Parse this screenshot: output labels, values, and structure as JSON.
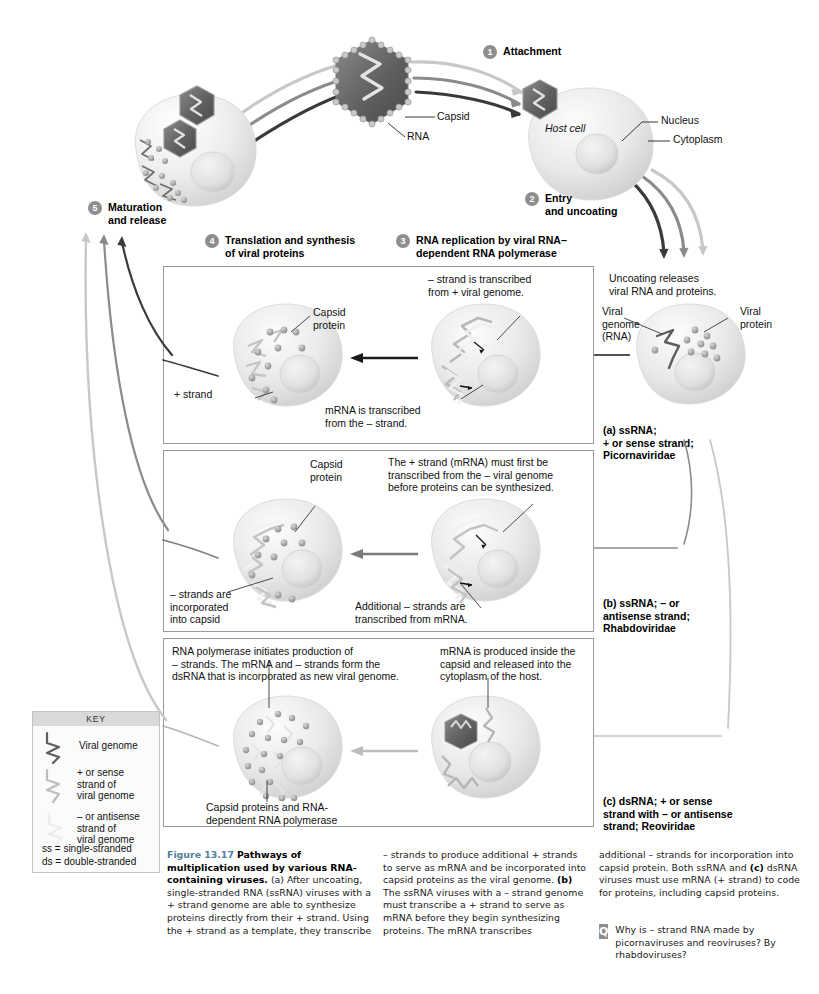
{
  "figure": {
    "number": "Figure 13.17",
    "title": "Pathways of multiplication used by various RNA-containing viruses.",
    "caption_col1": "(a) After uncoating, single-stranded RNA (ssRNA) viruses with a + strand genome are able to synthesize proteins directly from their + strand. Using the + strand as a template, they transcribe",
    "caption_col2_a": "– strands to produce additional + strands to serve as mRNA and be incorporated into capsid proteins as the viral genome.",
    "caption_col2_b_bold": "(b)",
    "caption_col2_b": " The ssRNA viruses with a – strand genome must transcribe a + strand to serve as mRNA before they begin synthesizing proteins. The mRNA transcribes",
    "caption_col3_a": "additional – strands for incorporation into capsid protein. Both ssRNA and",
    "caption_col3_c_bold": "(c)",
    "caption_col3_c": " dsRNA viruses must use mRNA (+ strand) to code for proteins, including capsid proteins.",
    "question_badge": "Q",
    "question": "Why is – strand RNA made by picornaviruses and reoviruses? By rhabdoviruses?"
  },
  "steps": [
    {
      "num": "1",
      "label": "Attachment"
    },
    {
      "num": "2",
      "label": "Entry\nand uncoating"
    },
    {
      "num": "3",
      "label": "RNA replication by viral RNA–\ndependent RNA polymerase"
    },
    {
      "num": "4",
      "label": "Translation and synthesis\nof viral proteins"
    },
    {
      "num": "5",
      "label": "Maturation\nand release"
    }
  ],
  "top_labels": {
    "capsid": "Capsid",
    "rna": "RNA",
    "nucleus": "Nucleus",
    "cytoplasm": "Cytoplasm",
    "host_cell": "Host cell"
  },
  "uncoating": {
    "note": "Uncoating releases\nviral RNA and proteins.",
    "viral_genome": "Viral\ngenome\n(RNA)",
    "viral_protein": "Viral\nprotein"
  },
  "panels": [
    {
      "id": "a",
      "type_label": "(a) ssRNA;\n+ or sense strand;\nPicornaviridae",
      "annotations": {
        "transcribed_note": "– strand is transcribed\nfrom + viral genome.",
        "mrna_note": "mRNA is transcribed\nfrom the – strand.",
        "capsid_protein": "Capsid\nprotein",
        "plus_strand": "+ strand"
      }
    },
    {
      "id": "b",
      "type_label": "(b) ssRNA; – or\nantisense strand;\nRhabdoviridae",
      "annotations": {
        "plus_strand_note": "The + strand (mRNA) must first be\ntranscribed from the – viral genome\nbefore proteins can be synthesized.",
        "additional_note": "Additional – strands are\ntranscribed from mRNA.",
        "capsid_protein": "Capsid\nprotein",
        "minus_strands": "– strands are\nincorporated\ninto capsid"
      }
    },
    {
      "id": "c",
      "type_label": "(c) dsRNA; + or sense\nstrand with – or antisense\nstrand; Reoviridae",
      "annotations": {
        "polymerase_note": "RNA polymerase initiates production of\n– strands. The mRNA and – strands form the\ndsRNA that is incorporated as new viral genome.",
        "mrna_note": "mRNA is produced inside the\ncapsid and released into the\ncytoplasm of the host.",
        "capsid_proteins": "Capsid proteins and RNA-\ndependent RNA polymerase"
      }
    }
  ],
  "key": {
    "title": "KEY",
    "items": [
      {
        "icon": "viral-genome-squiggle",
        "label": "Viral genome"
      },
      {
        "icon": "plus-sense-strand-squiggle",
        "label": "+ or sense\nstrand of\nviral genome"
      },
      {
        "icon": "minus-antisense-strand-squiggle",
        "label": "– or antisense\nstrand of\nviral genome"
      }
    ],
    "footnotes": "ss = single-stranded\nds = double-stranded"
  },
  "colors": {
    "dark_strand": "#4a4a4a",
    "mid_strand": "#9a9a9a",
    "light_strand": "#d0d0d0",
    "capsid_fill": "#6d6d6d",
    "cell_fill": "#ececec",
    "panel_border": "#9a9a9a",
    "badge_gray": "#8e8e8e",
    "caption_blue": "#4f7f9e"
  }
}
